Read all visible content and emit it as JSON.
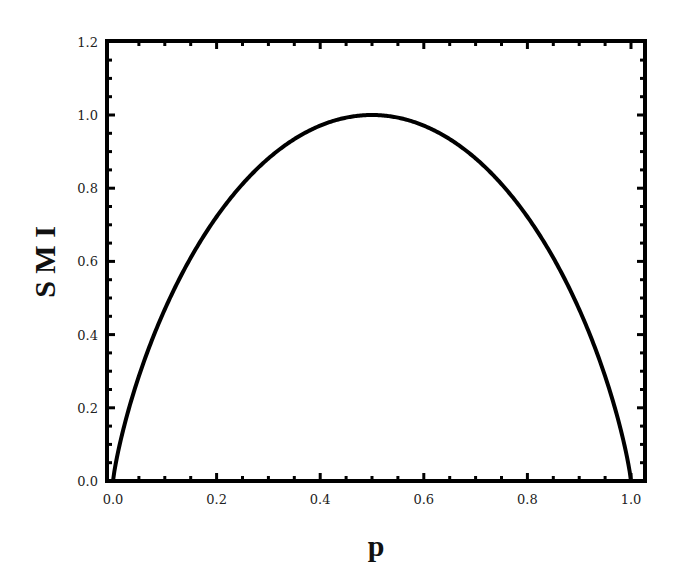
{
  "chart_data": {
    "type": "line",
    "title": "",
    "xlabel": "p",
    "ylabel": "S M I",
    "xlim": [
      0.0,
      1.03
    ],
    "ylim": [
      0.0,
      1.2
    ],
    "x_ticks": [
      "0.0",
      "0.2",
      "0.4",
      "0.6",
      "0.8",
      "1.0"
    ],
    "y_ticks": [
      "0.0",
      "0.2",
      "0.4",
      "0.6",
      "0.8",
      "1.0",
      "1.2"
    ],
    "grid": false,
    "legend": null,
    "series": [
      {
        "name": "SMI(p)",
        "description": "Binary entropy curve: -p log2 p - (1-p) log2 (1-p)",
        "color": "#000000",
        "x": [
          0.0,
          0.01,
          0.02,
          0.05,
          0.1,
          0.15,
          0.2,
          0.25,
          0.3,
          0.35,
          0.4,
          0.45,
          0.5,
          0.55,
          0.6,
          0.65,
          0.7,
          0.75,
          0.8,
          0.85,
          0.9,
          0.95,
          0.98,
          0.99,
          1.0
        ],
        "values": [
          0.0,
          0.081,
          0.141,
          0.286,
          0.469,
          0.61,
          0.722,
          0.811,
          0.881,
          0.934,
          0.971,
          0.993,
          1.0,
          0.993,
          0.971,
          0.934,
          0.881,
          0.811,
          0.722,
          0.61,
          0.469,
          0.286,
          0.141,
          0.081,
          0.0
        ]
      }
    ]
  },
  "plot": {
    "frame_color": "#000000",
    "line_color": "#000000",
    "background": "#ffffff"
  }
}
